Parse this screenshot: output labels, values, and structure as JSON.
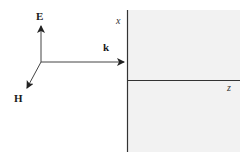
{
  "diagram": {
    "vectors": [
      {
        "name": "E",
        "label": "E",
        "direction": "up"
      },
      {
        "name": "k",
        "label": "k",
        "direction": "right"
      },
      {
        "name": "H",
        "label": "H",
        "direction": "down-left"
      }
    ],
    "axes": {
      "x_label": "x",
      "z_label": "z"
    },
    "colors": {
      "line": "#222222",
      "medium_fill": "#f2f2f2",
      "background": "#ffffff"
    }
  }
}
